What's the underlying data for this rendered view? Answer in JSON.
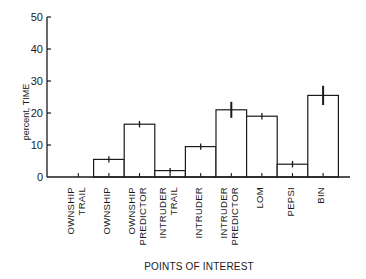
{
  "chart_data": {
    "type": "bar",
    "title": "",
    "xlabel": "POINTS OF INTEREST",
    "ylabel": "percent, TIME",
    "ylim": [
      0,
      50
    ],
    "yticks": [
      0,
      10,
      20,
      30,
      40,
      50
    ],
    "grid": false,
    "legend": null,
    "categories": [
      [
        "OWNSHIP",
        "TRAIL"
      ],
      [
        "OWNSHIP"
      ],
      [
        "OWNSHIP",
        "PREDICTOR"
      ],
      [
        "INTRUDER",
        "TRAIL"
      ],
      [
        "INTRUDER"
      ],
      [
        "INTRUDER",
        "PREDICTOR"
      ],
      [
        "LOM"
      ],
      [
        "PEPSI"
      ],
      [
        "BIN"
      ]
    ],
    "category_names": [
      "OWNSHIP TRAIL",
      "OWNSHIP",
      "OWNSHIP PREDICTOR",
      "INTRUDER TRAIL",
      "INTRUDER",
      "INTRUDER PREDICTOR",
      "LOM",
      "PEPSI",
      "BIN"
    ],
    "values": [
      0,
      5.5,
      16.5,
      2,
      9.5,
      21,
      19,
      4,
      25.5
    ],
    "error_bars": [
      0,
      1,
      1,
      0.8,
      1,
      2.5,
      1,
      1,
      3
    ],
    "bar_color": "#ffffff",
    "line_color": "#1a1a1a"
  }
}
